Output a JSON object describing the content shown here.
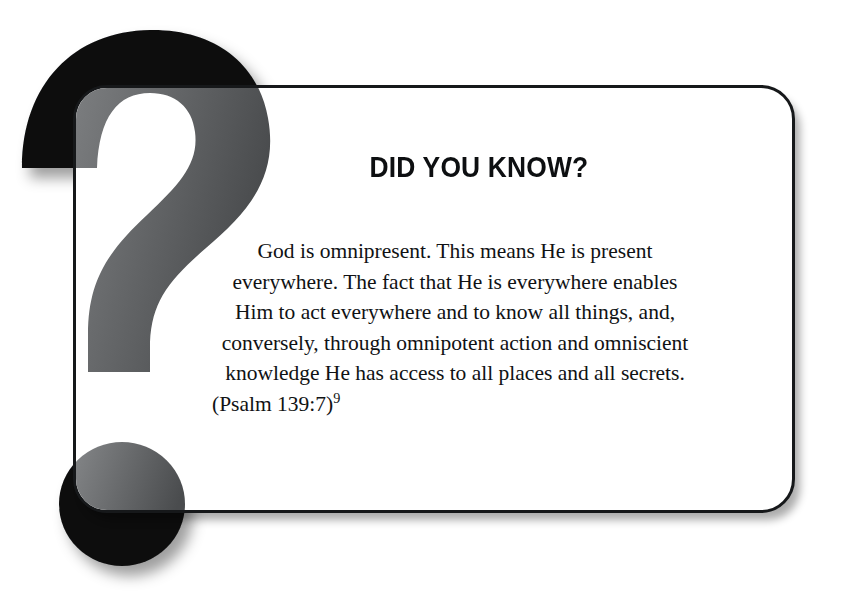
{
  "figure": {
    "kind": "did-you-know-callout-box",
    "icon": "question-mark-icon",
    "colors": {
      "frame_stroke": "#16181a",
      "icon_black": "#0b0c0d",
      "icon_gray": "#6e7072",
      "card_background": "#ffffff",
      "text": "#101214",
      "page_background": "#ffffff"
    }
  },
  "callout": {
    "title": "DID YOU KNOW?",
    "body_lines": [
      "God is omnipresent. This means He is present",
      "everywhere. The fact that He is everywhere enables",
      "Him to act everywhere and to know all things, and,",
      "conversely, through omnipotent action and omniscient",
      "knowledge He has access to all places and all secrets."
    ],
    "citation": "(Psalm 139:7)",
    "footnote_marker": "9",
    "full_body_text": "God is omnipresent. This means He is present everywhere. The fact that He is everywhere enables Him to act everywhere and to know all things, and, conversely, through omnipotent action and omniscient knowledge He has access to all places and all secrets. (Psalm 139:7)9"
  }
}
